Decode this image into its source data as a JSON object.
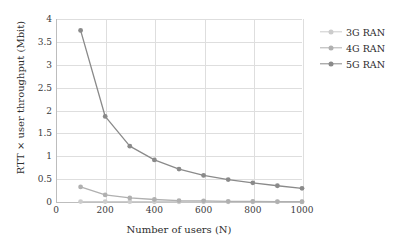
{
  "chart_data": {
    "type": "line",
    "title": "",
    "xlabel": "Number of users (N)",
    "ylabel": "RTT × user throughput (Mbit)",
    "x": [
      100,
      200,
      300,
      400,
      500,
      600,
      700,
      800,
      900,
      1000
    ],
    "xlim": [
      0,
      1000
    ],
    "ylim": [
      0,
      4
    ],
    "xticks": [
      "0",
      "200",
      "400",
      "600",
      "800",
      "1000"
    ],
    "xtick_values": [
      0,
      200,
      400,
      600,
      800,
      1000
    ],
    "yticks": [
      "0",
      "0.5",
      "1",
      "1.5",
      "2",
      "2.5",
      "3",
      "3.5",
      "4"
    ],
    "ytick_values": [
      0,
      0.5,
      1,
      1.5,
      2,
      2.5,
      3,
      3.5,
      4
    ],
    "grid": "both",
    "legend_position": "right",
    "series": [
      {
        "name": "3G RAN",
        "color": "#cccccc",
        "values": [
          0.01,
          0.01,
          0.008,
          0.006,
          0.005,
          0.004,
          0.003,
          0.003,
          0.002,
          0.002
        ]
      },
      {
        "name": "4G RAN",
        "color": "#b0b0b0",
        "values": [
          0.33,
          0.155,
          0.09,
          0.055,
          0.03,
          0.025,
          0.015,
          0.012,
          0.01,
          0.008
        ]
      },
      {
        "name": "5G RAN",
        "color": "#8a8a8a",
        "values": [
          3.75,
          1.87,
          1.22,
          0.92,
          0.72,
          0.58,
          0.49,
          0.42,
          0.355,
          0.3
        ]
      }
    ]
  },
  "legend": {
    "items": [
      {
        "label": "3G RAN",
        "color": "#cccccc"
      },
      {
        "label": "4G RAN",
        "color": "#b0b0b0"
      },
      {
        "label": "5G RAN",
        "color": "#8a8a8a"
      }
    ]
  },
  "style": {
    "gridline_color": "#dedede",
    "axis_color": "#bdbdbd",
    "background": "#ffffff",
    "tick_text_color": "#3a3a3a",
    "label_text_color": "#2e2e2e"
  }
}
